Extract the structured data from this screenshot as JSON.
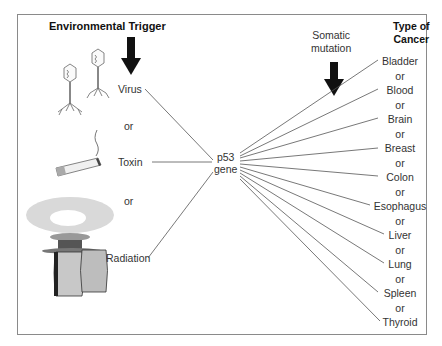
{
  "diagram": {
    "left_header": "Environmental Trigger",
    "right_header_line1": "Type of",
    "right_header_line2": "Cancer",
    "somatic_line1": "Somatic",
    "somatic_line2": "mutation",
    "center_line1": "p53",
    "center_line2": "gene",
    "triggers": [
      {
        "label": "Virus",
        "icon": "bacteriophage-icon"
      },
      {
        "label": "Toxin",
        "icon": "cigarette-icon"
      },
      {
        "label": "Radiation",
        "icon": "nuclear-cooling-tower-icon"
      }
    ],
    "or_label": "or",
    "cancers": [
      "Bladder",
      "Blood",
      "Brain",
      "Breast",
      "Colon",
      "Esophagus",
      "Liver",
      "Lung",
      "Spleen",
      "Thyroid"
    ],
    "colors": {
      "line": "#555555",
      "frame": "#8a8a8a",
      "arrow": "#111111"
    }
  }
}
